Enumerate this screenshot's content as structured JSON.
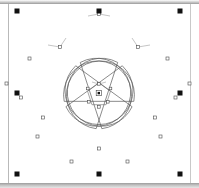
{
  "app": {
    "title": "Vector Editor Canvas",
    "view": "Path node editing"
  },
  "canvas": {
    "background_color": "#ffffff",
    "page_border_color": "#b9b9b9",
    "chrome_color": "#b4b4b4",
    "width": 199,
    "height": 188
  },
  "selection": {
    "label": "Selection bounding box",
    "handle_color": "#111111",
    "handle_size": 5,
    "handle_count": 8,
    "handles": [
      {
        "name": "handle-top-left",
        "x": 17,
        "y": 11,
        "cursor": "nwse-resize"
      },
      {
        "name": "handle-top-center",
        "x": 99,
        "y": 11,
        "cursor": "ns-resize"
      },
      {
        "name": "handle-top-right",
        "x": 180,
        "y": 11,
        "cursor": "nesw-resize"
      },
      {
        "name": "handle-middle-left",
        "x": 17,
        "y": 93,
        "cursor": "ew-resize"
      },
      {
        "name": "handle-middle-right",
        "x": 180,
        "y": 93,
        "cursor": "ew-resize"
      },
      {
        "name": "handle-bottom-left",
        "x": 17,
        "y": 174,
        "cursor": "nwse-resize"
      },
      {
        "name": "handle-bottom-center",
        "x": 99,
        "y": 174,
        "cursor": "ns-resize"
      },
      {
        "name": "handle-bottom-right",
        "x": 180,
        "y": 174,
        "cursor": "nesw-resize"
      }
    ]
  },
  "shapes": {
    "flower": {
      "name": "five-petal-flower-path",
      "stroke_color": "#5a5a5a",
      "fill": "none",
      "stroke_width": 0.7,
      "petal_count": 5,
      "center": {
        "x": 99,
        "y": 93
      },
      "outline_d": "M 99 11 C 117 11 133 26 133 45 C 133 52 130 58 126 63 C 133 57 142 54 151 54 C 170 54 185 69 185 88 C 185 106 170 121 151 121 C 143 121 136 118 130 114 C 136 120 140 128 140 138 C 140 156 125 171 106 171 C 95 171 86 166 80 158 C 74 166 64 171 54 171 C 35 171 20 156 20 138 C 20 128 24 120 30 114 C 24 118 17 121 9 121 C -10 121 -25 106 -25 88 C -25 69 -10 54 9 54 C 18 54 27 57 34 63 C 30 58 27 52 27 45 C 27 26 43 11 61 11",
      "node_markers": [
        {
          "name": "node-top",
          "type": "diamond",
          "x": 99,
          "y": 14
        },
        {
          "name": "node-upper-left",
          "type": "square",
          "x": 60,
          "y": 47
        },
        {
          "name": "node-upper-right",
          "type": "square",
          "x": 138,
          "y": 47
        },
        {
          "name": "node-left-upper",
          "type": "diamond",
          "x": 22,
          "y": 86
        },
        {
          "name": "node-right-upper",
          "type": "diamond",
          "x": 177,
          "y": 86
        },
        {
          "name": "node-left-lower",
          "type": "square",
          "x": 43,
          "y": 118
        },
        {
          "name": "node-right-lower",
          "type": "square",
          "x": 156,
          "y": 118
        },
        {
          "name": "node-left-bottom",
          "type": "diamond",
          "x": 37,
          "y": 136
        },
        {
          "name": "node-right-bottom",
          "type": "diamond",
          "x": 162,
          "y": 136
        },
        {
          "name": "node-bottom-center",
          "type": "diamond",
          "x": 99,
          "y": 158
        },
        {
          "name": "node-bottom-left",
          "type": "square",
          "x": 72,
          "y": 172
        },
        {
          "name": "node-bottom-right",
          "type": "square",
          "x": 126,
          "y": 172
        }
      ]
    },
    "star": {
      "name": "center-pentagon-path",
      "stroke_color": "#6a6a6a",
      "fill": "none",
      "stroke_width": 0.6,
      "vertex_count": 5,
      "center": {
        "x": 99,
        "y": 95
      },
      "radius": 12,
      "outline_d": "M 99 84 L 110 88 L 110 102 L 99 107 L 88 102 L 88 88 Z",
      "node_markers": [
        {
          "name": "star-node-top",
          "type": "square",
          "x": 99,
          "y": 84
        },
        {
          "name": "star-node-upper-right",
          "type": "square",
          "x": 110,
          "y": 88
        },
        {
          "name": "star-node-lower-right",
          "type": "diamond",
          "x": 110,
          "y": 102
        },
        {
          "name": "star-node-bottom",
          "type": "diamond",
          "x": 99,
          "y": 107
        },
        {
          "name": "star-node-lower-left",
          "type": "square",
          "x": 88,
          "y": 102
        },
        {
          "name": "star-node-upper-left",
          "type": "square",
          "x": 88,
          "y": 88
        }
      ],
      "center_marker": {
        "name": "rotation-center-marker",
        "x": 99,
        "y": 93
      }
    }
  },
  "tangents": [
    {
      "name": "tangent-top-left",
      "x1": 99,
      "y1": 14,
      "x2": 88,
      "y2": 16
    },
    {
      "name": "tangent-top-right",
      "x1": 99,
      "y1": 14,
      "x2": 110,
      "y2": 16
    },
    {
      "name": "tangent-ul-a",
      "x1": 60,
      "y1": 47,
      "x2": 48,
      "y2": 45
    },
    {
      "name": "tangent-ul-b",
      "x1": 60,
      "y1": 47,
      "x2": 66,
      "y2": 38
    },
    {
      "name": "tangent-ur-a",
      "x1": 138,
      "y1": 47,
      "x2": 150,
      "y2": 45
    },
    {
      "name": "tangent-ur-b",
      "x1": 138,
      "y1": 47,
      "x2": 132,
      "y2": 38
    },
    {
      "name": "tangent-star-top-l",
      "x1": 99,
      "y1": 84,
      "x2": 92,
      "y2": 83
    },
    {
      "name": "tangent-star-top-r",
      "x1": 99,
      "y1": 84,
      "x2": 106,
      "y2": 83
    }
  ]
}
